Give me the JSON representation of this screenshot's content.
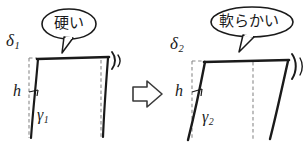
{
  "figure": {
    "background_color": "#ffffff",
    "ink_color": "#1a1a1a",
    "dashed_color": "#8a8a8a"
  },
  "panels": [
    {
      "id": "left-panel",
      "callout": {
        "text": "硬い",
        "meaning": "hard"
      },
      "labels": {
        "delta": "δ",
        "delta_sub": "1",
        "height": "h",
        "gamma": "γ",
        "gamma_sub": "1"
      },
      "icons": [
        "vibration-mark"
      ]
    },
    {
      "id": "right-panel",
      "callout": {
        "text": "軟らかい",
        "meaning": "soft"
      },
      "labels": {
        "delta": "δ",
        "delta_sub": "2",
        "height": "h",
        "gamma": "γ",
        "gamma_sub": "2"
      },
      "icons": [
        "vibration-mark"
      ]
    }
  ],
  "transition": {
    "icon": "right-arrow-outline"
  }
}
